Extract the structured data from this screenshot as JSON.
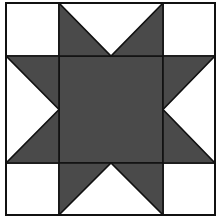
{
  "block": {
    "title": "Sawtooth Star quilt block",
    "grid": 4,
    "bounds": {
      "x0": 6,
      "y0": 3,
      "x1": 215,
      "y1": 215
    },
    "col_lines": [
      6,
      59,
      111,
      163,
      215
    ],
    "row_lines": [
      3,
      56,
      111,
      163,
      215
    ],
    "colors": {
      "background": "#ffffff",
      "dark": "#4a4a4a",
      "line": "#111111"
    },
    "line_width": 1.6,
    "pieces": [
      {
        "name": "corner-top-left",
        "type": "square",
        "fill": "light",
        "col": 0,
        "row": 0
      },
      {
        "name": "corner-top-right",
        "type": "square",
        "fill": "light",
        "col": 3,
        "row": 0
      },
      {
        "name": "corner-bottom-left",
        "type": "square",
        "fill": "light",
        "col": 0,
        "row": 3
      },
      {
        "name": "corner-bottom-right",
        "type": "square",
        "fill": "light",
        "col": 3,
        "row": 3
      },
      {
        "name": "center-square",
        "type": "square",
        "fill": "dark",
        "col": 1,
        "row": 1,
        "span": 2
      },
      {
        "name": "flying-geese-top",
        "type": "goose",
        "direction": "down",
        "col": 1,
        "row": 0,
        "span": 2
      },
      {
        "name": "flying-geese-bottom",
        "type": "goose",
        "direction": "up",
        "col": 1,
        "row": 3,
        "span": 2
      },
      {
        "name": "flying-geese-left",
        "type": "goose",
        "direction": "right",
        "col": 0,
        "row": 1,
        "span": 2
      },
      {
        "name": "flying-geese-right",
        "type": "goose",
        "direction": "left",
        "col": 3,
        "row": 1,
        "span": 2
      }
    ]
  }
}
